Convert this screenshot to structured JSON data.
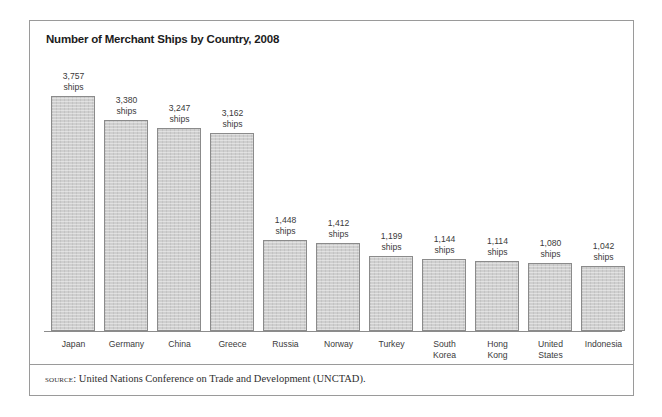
{
  "figure": {
    "title": "Number of Merchant Ships by Country, 2008",
    "source_label": "source:",
    "source_text": " United Nations Conference on Trade and Development (UNCTAD).",
    "unit_word": "ships"
  },
  "chart_data": {
    "type": "bar",
    "title": "Number of Merchant Ships by Country, 2008",
    "xlabel": "",
    "ylabel": "",
    "ylim": [
      0,
      3757
    ],
    "grid": false,
    "legend": "none",
    "unit": "ships",
    "categories": [
      "Japan",
      "Germany",
      "China",
      "Greece",
      "Russia",
      "Norway",
      "Turkey",
      "South Korea",
      "Hong Kong",
      "United States",
      "Indonesia"
    ],
    "category_lines": [
      [
        "Japan"
      ],
      [
        "Germany"
      ],
      [
        "China"
      ],
      [
        "Greece"
      ],
      [
        "Russia"
      ],
      [
        "Norway"
      ],
      [
        "Turkey"
      ],
      [
        "South",
        "Korea"
      ],
      [
        "Hong",
        "Kong"
      ],
      [
        "United",
        "States"
      ],
      [
        "Indonesia"
      ]
    ],
    "values": [
      3757,
      3380,
      3247,
      3162,
      1448,
      1412,
      1199,
      1144,
      1114,
      1080,
      1042
    ],
    "value_labels": [
      "3,757",
      "3,380",
      "3,247",
      "3,162",
      "1,448",
      "1,412",
      "1,199",
      "1,144",
      "1,114",
      "1,080",
      "1,042"
    ],
    "colors": {
      "bar_fill": "#cfcfcf",
      "bar_border": "#8b8b8b",
      "axis": "#8c8c8c",
      "frame": "#9a9a9a",
      "text": "#3a3a3a",
      "title_text": "#1c1c1c"
    }
  }
}
